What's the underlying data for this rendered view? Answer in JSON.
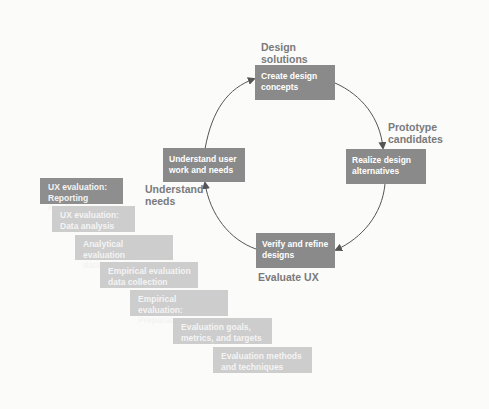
{
  "cycle": {
    "boxes": [
      {
        "id": "create",
        "text_lines": [
          "Create design",
          "concepts"
        ]
      },
      {
        "id": "realize",
        "text_lines": [
          "Realize design",
          "alternatives"
        ]
      },
      {
        "id": "verify",
        "text_lines": [
          "Verify and refine",
          "designs"
        ]
      },
      {
        "id": "understand",
        "text_lines": [
          "Understand user",
          "work and needs"
        ]
      }
    ],
    "labels": {
      "design_solutions": [
        "Design",
        "solutions"
      ],
      "prototype_candidates": [
        "Prototype",
        "candidates"
      ],
      "understand_needs": [
        "Understand",
        "needs"
      ],
      "evaluate_ux": "Evaluate UX"
    }
  },
  "staircase": [
    {
      "lines": [
        "UX evaluation:",
        "Reporting results"
      ],
      "color": "#8e8e8e"
    },
    {
      "lines": [
        "UX evaluation:",
        "Data analysis"
      ],
      "color": "#cdcdcd"
    },
    {
      "lines": [
        "Analytical evaluation",
        "data collection"
      ],
      "color": "#cdcdcd"
    },
    {
      "lines": [
        "Empirical evaluation",
        "data collection"
      ],
      "color": "#cdcdcd"
    },
    {
      "lines": [
        "Empirical evaluation:",
        "Preparation"
      ],
      "color": "#cdcdcd"
    },
    {
      "lines": [
        "Evaluation goals,",
        "metrics, and targets"
      ],
      "color": "#cdcdcd"
    },
    {
      "lines": [
        "Evaluation methods",
        "and techniques"
      ],
      "color": "#cdcdcd"
    }
  ],
  "colors": {
    "dark_box": "#8a8a8a",
    "light_box": "#cdcdcd",
    "arrow": "#555555",
    "label": "#7a7a7a"
  }
}
